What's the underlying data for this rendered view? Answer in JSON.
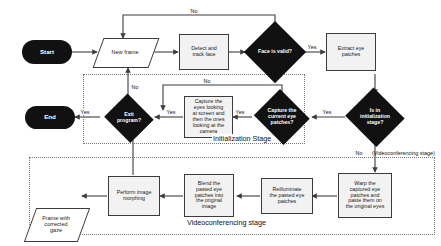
{
  "diagram": {
    "colors": {
      "terminal_fill": "#111111",
      "terminal_text": "#ffffff",
      "process_fill": "#f2f2f2",
      "process_border": "#3c3c3c",
      "decision_fill": "#111111",
      "decision_text": "#ffffff",
      "connector": "#3c3c3c",
      "stage_border": "#777777",
      "background": "#ffffff"
    }
  },
  "nodes": {
    "start": {
      "label": "Start",
      "type": "terminal"
    },
    "new_frame": {
      "label": "New frame",
      "type": "data"
    },
    "detect_track_face": {
      "label": "Detect and\ntrack face",
      "type": "process"
    },
    "face_is_valid": {
      "label": "Face is valid?",
      "type": "decision"
    },
    "extract_eye_patches": {
      "label": "Extract eye\npatches",
      "type": "process"
    },
    "is_in_initialization_stage": {
      "label": "Is in\ninitialization\nstage?",
      "type": "decision"
    },
    "capture_current_eye_patches": {
      "label": "Capture the\ncurrent eye\npatches?",
      "type": "decision"
    },
    "capture_eyes_looking": {
      "label": "Capture the\neyes looking\nat screen and\nthen the ones\nlooking at the\ncamera",
      "type": "process"
    },
    "exit_program": {
      "label": "Exit\nprogram?",
      "type": "decision"
    },
    "end": {
      "label": "End",
      "type": "terminal"
    },
    "warp_captured": {
      "label": "Warp the\ncaptured eye\npatches and\npaste them on\nthe original eyes",
      "type": "process"
    },
    "reilluminate": {
      "label": "Reilluminate\nthe pasted eye\npatches",
      "type": "process"
    },
    "blend_patches": {
      "label": "Blend the\npasted eye\npatches into\nthe original\nimage",
      "type": "process"
    },
    "perform_morphing": {
      "label": "Perform image\nmorphing",
      "type": "process"
    },
    "frame_corrected_gaze": {
      "label": "Frame with\ncorrected\ngaze",
      "type": "data"
    }
  },
  "edge_labels": {
    "face_invalid_no": "No",
    "face_valid_yes": "Yes",
    "init_stage_yes": "Yes",
    "init_stage_no": "No",
    "capture_patches_yes": "Yes",
    "capture_patches_no": "No",
    "capture_done_yes": "Yes",
    "exit_yes": "Yes",
    "exit_no": "No"
  },
  "stages": {
    "initialization": {
      "title": "Initialization Stage"
    },
    "videoconferencing": {
      "title": "Videoconferencing stage"
    },
    "videoconferencing_note": "(Videoconferencing stage)"
  }
}
